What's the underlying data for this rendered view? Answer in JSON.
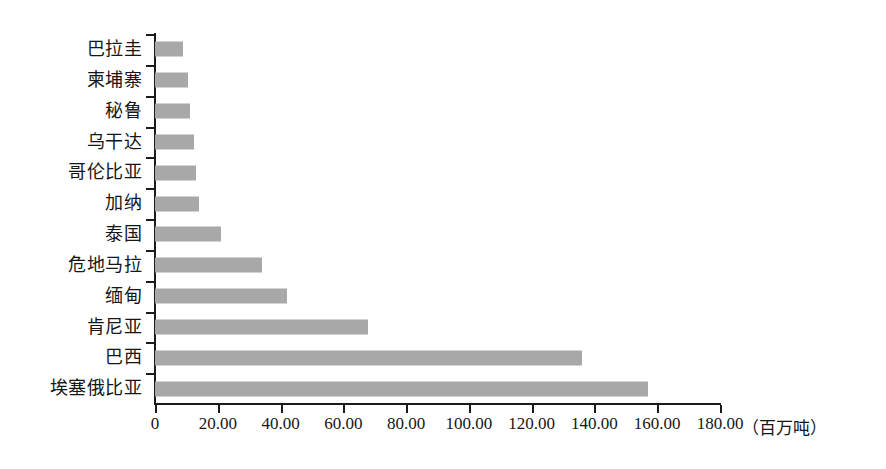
{
  "chart_data": {
    "type": "bar",
    "orientation": "horizontal",
    "title": "",
    "subtitle": "",
    "xlabel": "（百万吨）",
    "ylabel": "",
    "xlim": [
      0,
      180
    ],
    "grid": false,
    "legend": null,
    "bar_color": "#a8a8a8",
    "axis_color": "#1b1b1b",
    "categories": [
      "巴拉圭",
      "柬埔寨",
      "秘鲁",
      "乌干达",
      "哥伦比亚",
      "加纳",
      "泰国",
      "危地马拉",
      "缅甸",
      "肯尼亚",
      "巴西",
      "埃塞俄比亚"
    ],
    "values": [
      9,
      10.5,
      11,
      12.5,
      13,
      14,
      21,
      34,
      42,
      68,
      136,
      157
    ],
    "xticks": [
      0,
      20,
      40,
      60,
      80,
      100,
      120,
      140,
      160,
      180
    ],
    "xtick_labels": [
      "0",
      "20.00",
      "40.00",
      "60.00",
      "80.00",
      "100.00",
      "120.00",
      "140.00",
      "160.00",
      "180.00"
    ],
    "unit_note": "（百万吨）"
  }
}
